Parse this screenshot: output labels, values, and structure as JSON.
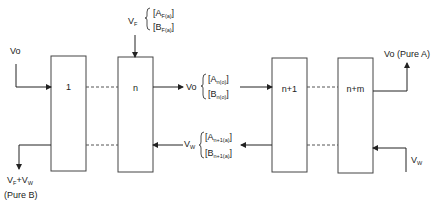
{
  "diagram": {
    "stages": [
      {
        "id": "stage-1",
        "label": "1"
      },
      {
        "id": "stage-n",
        "label": "n"
      },
      {
        "id": "stage-n1",
        "label": "n+1"
      },
      {
        "id": "stage-nm",
        "label": "n+m"
      }
    ],
    "labels": {
      "vo_in": "Vo",
      "vf": "V",
      "vf_sub": "F",
      "feed_a": "[A",
      "feed_a_sub": "F(a)",
      "feed_b": "[B",
      "feed_b_sub": "F(a)",
      "close": "]",
      "vo_mid": "Vo",
      "mid_a": "[A",
      "mid_a_sub": "n(o)",
      "mid_b": "[B",
      "mid_b_sub": "n(o)",
      "vw_mid": "V",
      "vw_mid_sub": "W",
      "ret_a": "[A",
      "ret_a_sub": "n+1(a)",
      "ret_b": "[B",
      "ret_b_sub": "n+1(a)",
      "out_a": "Vo (Pure A)",
      "vw_in": "V",
      "vw_in_sub": "W",
      "out_b_v": "V",
      "out_b_vf_sub": "F",
      "out_b_plus": "+V",
      "out_b_vw_sub": "W",
      "out_b_note": "(Pure B)"
    },
    "colors": {
      "line": "#222222",
      "dashed": "#555555",
      "background": "#ffffff"
    }
  }
}
